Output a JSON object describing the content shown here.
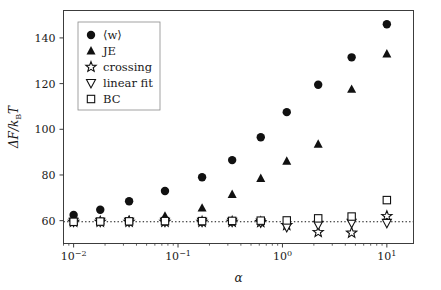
{
  "chart_data": {
    "type": "scatter",
    "title": "",
    "xlabel": "α",
    "ylabel": "ΔF/kBT",
    "ylabel_parts": {
      "delta_f": "ΔF/",
      "k": "k",
      "sub_b": "B",
      "t": "T"
    },
    "xscale": "log",
    "yscale": "linear",
    "xlim": [
      0.008,
      18.0
    ],
    "ylim": [
      50.0,
      152.0
    ],
    "grid": false,
    "legend_position": "upper left",
    "xtick_labels": [
      "10⁻²",
      "10⁻¹",
      "10⁰",
      "10¹"
    ],
    "xtick_label_parts": [
      {
        "base": "10",
        "exp": "−2"
      },
      {
        "base": "10",
        "exp": "−1"
      },
      {
        "base": "10",
        "exp": "0"
      },
      {
        "base": "10",
        "exp": "1"
      }
    ],
    "xticks": [
      0.01,
      0.1,
      1.0,
      10.0
    ],
    "ytick_labels": [
      "60",
      "80",
      "100",
      "120",
      "140"
    ],
    "yticks": [
      60,
      80,
      100,
      120,
      140
    ],
    "reference_line": {
      "y": 59.5,
      "style": "dotted",
      "label": ""
    },
    "series": [
      {
        "name": "⟨w⟩",
        "legend_label": "⟨w⟩",
        "marker": "filled-circle",
        "color": "#111111",
        "x": [
          0.01,
          0.018,
          0.034,
          0.075,
          0.17,
          0.33,
          0.62,
          1.1,
          2.2,
          4.6,
          10.0
        ],
        "y": [
          62.5,
          64.8,
          68.5,
          73.0,
          79.0,
          86.5,
          96.5,
          107.5,
          119.5,
          131.5,
          146.0
        ]
      },
      {
        "name": "JE",
        "legend_label": "JE",
        "marker": "filled-triangle-up",
        "color": "#111111",
        "x": [
          0.01,
          0.018,
          0.034,
          0.075,
          0.17,
          0.33,
          0.62,
          1.1,
          2.2,
          4.6,
          10.0
        ],
        "y": [
          59.8,
          60.0,
          60.3,
          62.0,
          65.5,
          71.5,
          78.5,
          86.0,
          93.5,
          117.5,
          133.0
        ]
      },
      {
        "name": "crossing",
        "legend_label": "crossing",
        "marker": "open-star",
        "color": "#111111",
        "x": [
          0.01,
          0.018,
          0.034,
          0.075,
          0.17,
          0.33,
          0.62,
          1.1,
          2.2,
          4.6,
          10.0
        ],
        "y": [
          59.5,
          59.5,
          59.5,
          59.5,
          59.5,
          59.5,
          59.3,
          58.0,
          55.0,
          54.7,
          62.0
        ]
      },
      {
        "name": "linear fit",
        "legend_label": "linear fit",
        "marker": "open-triangle-down",
        "color": "#111111",
        "x": [
          0.01,
          0.018,
          0.034,
          0.075,
          0.17,
          0.33,
          0.62,
          1.1,
          2.2,
          4.6,
          10.0
        ],
        "y": [
          59.5,
          59.5,
          59.5,
          59.5,
          59.5,
          59.5,
          59.2,
          57.2,
          58.2,
          59.0,
          59.0
        ]
      },
      {
        "name": "BC",
        "legend_label": "BC",
        "marker": "open-square",
        "color": "#111111",
        "x": [
          0.01,
          0.018,
          0.034,
          0.075,
          0.17,
          0.33,
          0.62,
          1.1,
          2.2,
          4.6,
          10.0
        ],
        "y": [
          59.5,
          59.6,
          59.7,
          59.8,
          59.8,
          59.9,
          60.0,
          60.1,
          61.0,
          61.8,
          69.0
        ]
      }
    ]
  }
}
